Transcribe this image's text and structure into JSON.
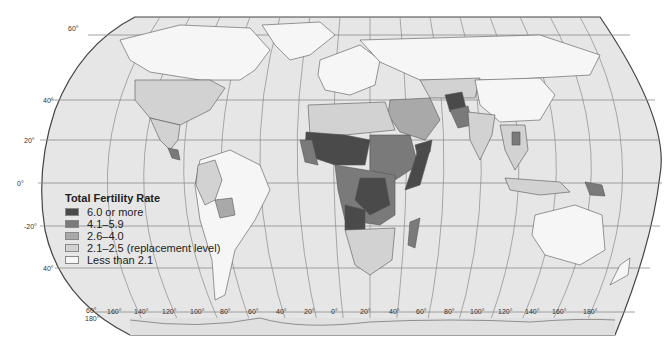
{
  "legend": {
    "title": "Total Fertility Rate",
    "items": [
      {
        "label": "6.0 or more",
        "color": "#4a4a4a"
      },
      {
        "label": "4.1–5.9",
        "color": "#7a7a7a"
      },
      {
        "label": "2.6–4.0",
        "color": "#a9a9a9"
      },
      {
        "label": "2.1–2.5 (replacement level)",
        "color": "#d2d2d2"
      },
      {
        "label": "Less than 2.1",
        "color": "#f6f6f6"
      }
    ]
  },
  "latitude_labels": [
    "60°",
    "40°",
    "20°",
    "0°",
    "-20°",
    "40°",
    "60°"
  ],
  "longitude_labels": [
    "180°",
    "160°",
    "140°",
    "120°",
    "100°",
    "80°",
    "60°",
    "40°",
    "20°",
    "0°",
    "20°",
    "40°",
    "60°",
    "80°",
    "100°",
    "120°",
    "140°",
    "160°",
    "180°"
  ],
  "colors": {
    "ocean": "#e6e6e6",
    "graticule": "#8a8a8a",
    "border": "#555555",
    "frame": "#444444"
  }
}
